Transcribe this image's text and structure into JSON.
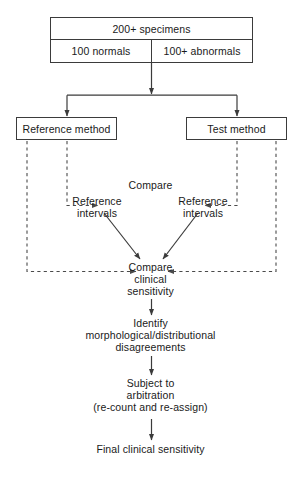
{
  "diagram": {
    "ink_color": "#1a1a1a",
    "line_color": "#3b3b3b",
    "dashed_color": "#4a4a4a"
  },
  "boxes": {
    "specimens": "200+ specimens",
    "normals": "100 normals",
    "abnormals": "100+ abnormals",
    "reference_method": "Reference method",
    "test_method": "Test method"
  },
  "labels": {
    "compare": "Compare",
    "reference_intervals_left_line1": "Reference",
    "reference_intervals_left_line2": "intervals",
    "reference_intervals_right_line1": "Reference",
    "reference_intervals_right_line2": "intervals",
    "compare_clinical_line1": "Compare",
    "compare_clinical_line2": "clinical",
    "compare_clinical_line3": "sensitivity",
    "identify_line1": "Identify",
    "identify_line2": "morphological/distributional",
    "identify_line3": "disagreements",
    "subject_line1": "Subject to",
    "subject_line2": "arbitration",
    "subject_line3": "(re-count and re-assign)",
    "final": "Final clinical sensitivity"
  }
}
